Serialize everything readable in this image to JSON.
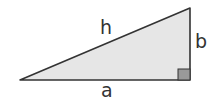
{
  "diagram": {
    "type": "right-triangle",
    "labels": {
      "hypotenuse": "h",
      "vertical_leg": "b",
      "horizontal_leg": "a"
    },
    "colors": {
      "fill": "#e6e6e6",
      "stroke": "#333333",
      "right_angle_marker": "#999999"
    }
  }
}
